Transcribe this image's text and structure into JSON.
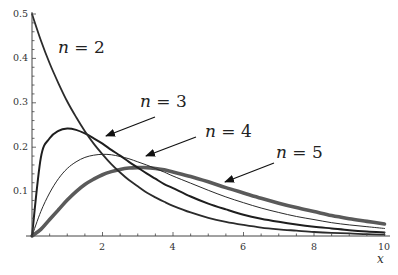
{
  "chart_data": {
    "type": "line",
    "title": "",
    "xlabel": "x",
    "ylabel": "",
    "xlim": [
      0,
      10
    ],
    "ylim": [
      0,
      0.5
    ],
    "grid": false,
    "legend": "none (inline annotations with arrows)",
    "x_ticks": [
      2,
      4,
      6,
      8,
      10
    ],
    "x_tick_labels": [
      "2",
      "4",
      "6",
      "8",
      "10"
    ],
    "y_ticks": [
      0.1,
      0.2,
      0.3,
      0.4,
      0.5
    ],
    "y_tick_labels": [
      "0.1",
      "0.2",
      "0.3",
      "0.4",
      "0.5"
    ],
    "x": [
      0,
      0.25,
      0.5,
      0.75,
      1,
      1.25,
      1.5,
      1.75,
      2,
      2.25,
      2.5,
      2.75,
      3,
      3.25,
      3.5,
      3.75,
      4,
      4.5,
      5,
      5.5,
      6,
      6.5,
      7,
      7.5,
      8,
      8.5,
      9,
      9.5,
      10
    ],
    "series": [
      {
        "name": "n = 2",
        "stroke": "#2b2b2b",
        "width": 1.8,
        "values": [
          0.5,
          0.441,
          0.389,
          0.344,
          0.303,
          0.268,
          0.236,
          0.208,
          0.184,
          0.162,
          0.143,
          0.126,
          0.112,
          0.098,
          0.087,
          0.077,
          0.068,
          0.053,
          0.041,
          0.032,
          0.025,
          0.019,
          0.015,
          0.012,
          0.009,
          0.007,
          0.006,
          0.004,
          0.003
        ]
      },
      {
        "name": "n = 3",
        "stroke": "#1e1e1e",
        "width": 2.0,
        "values": [
          0,
          0.176,
          0.22,
          0.237,
          0.242,
          0.239,
          0.231,
          0.22,
          0.208,
          0.194,
          0.181,
          0.167,
          0.154,
          0.141,
          0.129,
          0.117,
          0.108,
          0.089,
          0.073,
          0.06,
          0.048,
          0.039,
          0.032,
          0.026,
          0.021,
          0.017,
          0.013,
          0.01,
          0.008
        ]
      },
      {
        "name": "n = 4",
        "stroke": "#2a2a2a",
        "width": 1.0,
        "values": [
          0,
          0.055,
          0.097,
          0.129,
          0.152,
          0.167,
          0.177,
          0.182,
          0.184,
          0.183,
          0.179,
          0.174,
          0.167,
          0.16,
          0.152,
          0.144,
          0.135,
          0.119,
          0.103,
          0.088,
          0.075,
          0.063,
          0.053,
          0.044,
          0.037,
          0.03,
          0.025,
          0.021,
          0.017
        ]
      },
      {
        "name": "n = 5",
        "stroke": "#5a5a5a",
        "width": 3.6,
        "values": [
          0,
          0.015,
          0.037,
          0.059,
          0.081,
          0.1,
          0.116,
          0.128,
          0.138,
          0.145,
          0.15,
          0.153,
          0.154,
          0.154,
          0.152,
          0.149,
          0.144,
          0.134,
          0.122,
          0.109,
          0.097,
          0.085,
          0.074,
          0.064,
          0.055,
          0.046,
          0.039,
          0.033,
          0.027
        ]
      }
    ],
    "annotations": [
      {
        "series": "n = 2",
        "var": "n",
        "eq": " = ",
        "num": "2",
        "text_x": 58,
        "text_y": 53,
        "arrow": null
      },
      {
        "series": "n = 3",
        "var": "n",
        "eq": " = ",
        "num": "3",
        "text_x": 140,
        "text_y": 107,
        "arrow": [
          155,
          117,
          106,
          136
        ]
      },
      {
        "series": "n = 4",
        "var": "n",
        "eq": " = ",
        "num": "4",
        "text_x": 205,
        "text_y": 137,
        "arrow": [
          196,
          137,
          146,
          156
        ]
      },
      {
        "series": "n = 5",
        "var": "n",
        "eq": " = ",
        "num": "5",
        "text_x": 276,
        "text_y": 158,
        "arrow": [
          274,
          163,
          225,
          182
        ]
      }
    ]
  },
  "axes": {
    "x_label": "x",
    "x_tick_labels": [
      "2",
      "4",
      "6",
      "8",
      "10"
    ],
    "y_tick_labels": [
      "0.1",
      "0.2",
      "0.3",
      "0.4",
      "0.5"
    ]
  },
  "labels": {
    "n2": {
      "var": "n",
      "rest": " = 2"
    },
    "n3": {
      "var": "n",
      "rest": " = 3"
    },
    "n4": {
      "var": "n",
      "rest": " = 4"
    },
    "n5": {
      "var": "n",
      "rest": " = 5"
    }
  }
}
